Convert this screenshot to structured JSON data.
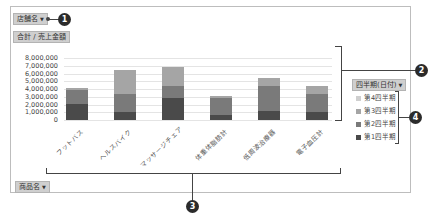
{
  "filters": {
    "row_field_label": "店舗名",
    "value_label": "合計 / 売上金額",
    "legend_field_label": "四半期(日付)",
    "axis_field_label": "商品名"
  },
  "callouts": [
    "1",
    "2",
    "3",
    "4"
  ],
  "colors": {
    "q1": "#4a4a4a",
    "q2": "#7a7a7a",
    "q3": "#a5a5a5",
    "q4": "#cfcfcf",
    "grid": "#e4e4e4",
    "button_bg": "#cfcfcf"
  },
  "chart_data": {
    "type": "bar",
    "stacked": true,
    "title": "",
    "xlabel": "",
    "ylabel": "合計 / 売上金額",
    "ylim": [
      0,
      8000000
    ],
    "yticks": [
      "8,000,000",
      "7,000,000",
      "6,000,000",
      "5,000,000",
      "4,000,000",
      "3,000,000",
      "2,000,000",
      "1,000,000",
      "0"
    ],
    "categories": [
      "フットバス",
      "ヘルスバイク",
      "マッサージチェア",
      "体重体脂肪計",
      "低周波治療器",
      "電子血圧計"
    ],
    "series": [
      {
        "name": "第1四半期",
        "values": [
          2100000,
          1000000,
          2800000,
          600000,
          1200000,
          1000000
        ]
      },
      {
        "name": "第2四半期",
        "values": [
          1800000,
          2400000,
          1600000,
          2300000,
          3200000,
          2400000
        ]
      },
      {
        "name": "第3四半期",
        "values": [
          200000,
          3100000,
          2400000,
          200000,
          1000000,
          1000000
        ]
      },
      {
        "name": "第4四半期",
        "values": [
          0,
          0,
          0,
          0,
          0,
          0
        ]
      }
    ],
    "legend": [
      "第4四半期",
      "第3四半期",
      "第2四半期",
      "第1四半期"
    ],
    "legend_position": "right",
    "grid": true
  }
}
